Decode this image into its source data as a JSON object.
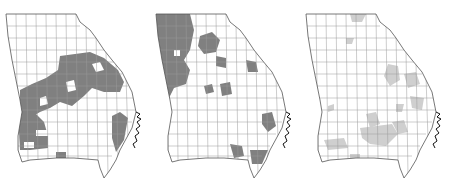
{
  "figure": {
    "panels": [
      {
        "id": "map-1",
        "fill_color": "#808080",
        "highlighted_region_description": "central-east band and southwest counties plus southeast coastal strip"
      },
      {
        "id": "map-2",
        "fill_color": "#808080",
        "highlighted_region_description": "northwest counties, scattered north-central, and southeast coastal counties"
      },
      {
        "id": "map-3",
        "fill_color": "#cfcfcf",
        "highlighted_region_description": "scattered counties in east-central and south-central Georgia"
      }
    ],
    "colors": {
      "outline": "#555555",
      "county_border": "#9a9a9a",
      "unfilled": "#ffffff",
      "coast": "#111111"
    }
  }
}
